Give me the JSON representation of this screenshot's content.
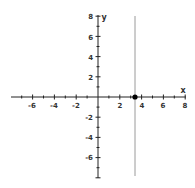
{
  "chart_data": {
    "type": "line",
    "title": "",
    "xlabel": "x",
    "ylabel": "y",
    "xlim": [
      -8,
      8
    ],
    "ylim": [
      -8,
      8
    ],
    "grid": false,
    "x_ticks": [
      -6,
      -4,
      -2,
      2,
      4,
      6,
      8
    ],
    "y_ticks": [
      8,
      6,
      4,
      2,
      -2,
      -4,
      -6
    ],
    "series": [
      {
        "name": "vertical line x = 3.4",
        "type": "vertical_line",
        "x": 3.4,
        "color": "#9a9a9a"
      }
    ],
    "points": [
      {
        "x": 3.4,
        "y": 0,
        "marker": "filled-circle",
        "color": "#000000"
      }
    ]
  },
  "axes": {
    "x_label": "x",
    "y_label": "y",
    "x_tick_labels": [
      "-6",
      "-4",
      "-2",
      "2",
      "4",
      "6",
      "8"
    ],
    "y_tick_labels": [
      "8",
      "6",
      "4",
      "2",
      "-2",
      "-4",
      "-6"
    ]
  }
}
